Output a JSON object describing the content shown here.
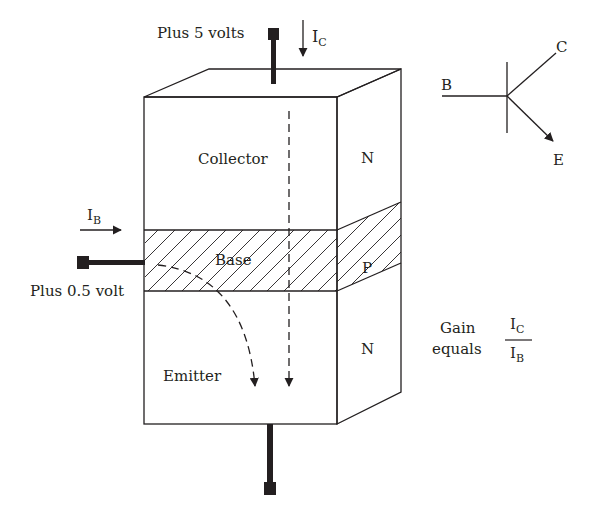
{
  "diagram": {
    "terminals": {
      "collector_voltage": "Plus 5 volts",
      "base_voltage": "Plus 0.5 volt"
    },
    "regions": {
      "collector": "Collector",
      "base": "Base",
      "emitter": "Emitter",
      "collector_type": "N",
      "base_type": "P",
      "emitter_type": "N"
    },
    "currents": {
      "collector_main": "I",
      "collector_sub": "C",
      "base_main": "I",
      "base_sub": "B"
    },
    "symbol": {
      "base": "B",
      "collector": "C",
      "emitter": "E"
    },
    "gain": {
      "line1": "Gain",
      "line2": "equals",
      "numerator_main": "I",
      "numerator_sub": "C",
      "denominator_main": "I",
      "denominator_sub": "B"
    },
    "colors": {
      "ink": "#231f20",
      "background": "#ffffff"
    }
  }
}
